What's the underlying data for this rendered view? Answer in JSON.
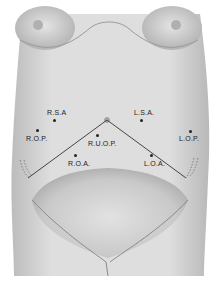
{
  "diagram": {
    "positions": [
      {
        "id": "rsa",
        "label": "R.S.A",
        "dot": [
          54,
          120
        ],
        "text": [
          47,
          110
        ]
      },
      {
        "id": "lsa",
        "label": "L.S.A.",
        "dot": [
          141,
          120
        ],
        "text": [
          134,
          110
        ]
      },
      {
        "id": "rop",
        "label": "R.O.P.",
        "dot": [
          37,
          130
        ],
        "text": [
          26,
          136
        ]
      },
      {
        "id": "lop",
        "label": "L.O.P.",
        "dot": [
          190,
          131
        ],
        "text": [
          179,
          136
        ]
      },
      {
        "id": "ruop",
        "label": "R.U.O.P.",
        "dot": [
          97,
          135
        ],
        "text": [
          88,
          141
        ]
      },
      {
        "id": "roa",
        "label": "R.O.A.",
        "dot": [
          75,
          155
        ],
        "text": [
          68,
          161
        ]
      },
      {
        "id": "loa",
        "label": "L.O.A.",
        "dot": [
          151,
          155
        ],
        "text": [
          144,
          161
        ]
      }
    ],
    "colors": {
      "skin_light": "#e6e6e6",
      "skin_mid": "#cfcfcf",
      "skin_dark": "#9a9a9a",
      "line": "#333333",
      "text": "#222222"
    }
  }
}
